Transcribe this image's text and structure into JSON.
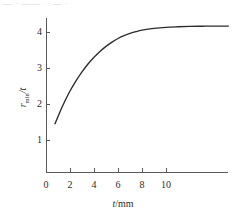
{
  "figure": {
    "top_remnant_text": "— · —— ·· — ·",
    "background_color": "#ffffff",
    "axis_color": "#5a5a5e",
    "curve_color": "#2b2b2f"
  },
  "axes": {
    "x_title_var": "t",
    "x_title_unit": "/mm",
    "y_title_var": "r",
    "y_title_sub": "min",
    "y_title_rest": "/t"
  },
  "chart_data": {
    "type": "line",
    "title": "",
    "subtitle": "",
    "xlabel": "t/mm",
    "ylabel": "r_min/t",
    "xlim": [
      0,
      15.2
    ],
    "ylim": [
      0,
      4.6
    ],
    "xticks": [
      0,
      2,
      4,
      6,
      8,
      10
    ],
    "xtick_labels": [
      "0",
      "2",
      "4",
      "6",
      "8",
      "10"
    ],
    "yticks": [
      1,
      2,
      3,
      4
    ],
    "ytick_labels": [
      "1",
      "2",
      "3",
      "4"
    ],
    "grid": false,
    "legend": null,
    "legend_position": "none",
    "annotations": [],
    "series": [
      {
        "name": "r_min/t",
        "color": "#2b2b2f",
        "line_width": 1.35,
        "marker": "none",
        "description": "Monotonic saturating curve rising steeply from t=0.75 and levelling off near 4.15",
        "x": [
          0.75,
          1.0,
          1.25,
          1.5,
          1.75,
          2.0,
          2.5,
          3.0,
          3.5,
          4.0,
          4.5,
          5.0,
          5.5,
          6.0,
          6.5,
          7.0,
          7.5,
          8.0,
          9.0,
          10.0,
          11.0,
          12.0,
          13.0,
          14.0,
          15.2
        ],
        "y": [
          1.45,
          1.65,
          1.85,
          2.03,
          2.2,
          2.36,
          2.64,
          2.89,
          3.11,
          3.3,
          3.46,
          3.6,
          3.72,
          3.82,
          3.9,
          3.96,
          4.01,
          4.05,
          4.1,
          4.13,
          4.145,
          4.155,
          4.16,
          4.163,
          4.165
        ]
      }
    ]
  },
  "geometry": {
    "plot_left_px": 46,
    "plot_bottom_px": 172,
    "plot_right_px": 228,
    "plot_top_px": 18,
    "x_px_per_unit": 12.0,
    "y_px_per_unit": 36.0,
    "x_origin_value": 0,
    "y_value_at_bottom": 0.1111
  }
}
